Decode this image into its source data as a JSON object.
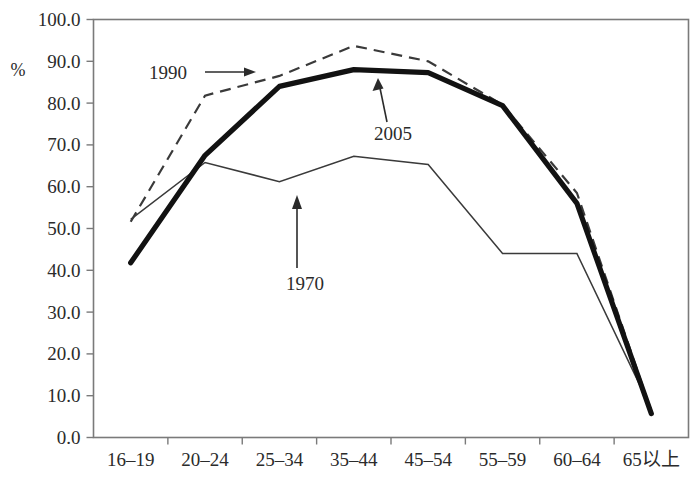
{
  "chart_data": {
    "type": "line",
    "title": "",
    "xlabel": "",
    "ylabel": "%",
    "ylim": [
      0.0,
      100.0
    ],
    "ytick_step": 10.0,
    "grid": false,
    "legend_position": "inline-annotations",
    "categories": [
      "16–19",
      "20–24",
      "25–34",
      "35–44",
      "45–54",
      "55–59",
      "60–64",
      "65以上"
    ],
    "ytick_labels": [
      "100.0",
      "90.0",
      "80.0",
      "70.0",
      "60.0",
      "50.0",
      "40.0",
      "30.0",
      "20.0",
      "10.0",
      "0.0"
    ],
    "ytick_values": [
      100.0,
      90.0,
      80.0,
      70.0,
      60.0,
      50.0,
      40.0,
      30.0,
      20.0,
      10.0,
      0.0
    ],
    "series": [
      {
        "name": "1970",
        "style": "thin-solid",
        "color": "#3a3a3a",
        "values": [
          52.2,
          65.8,
          61.2,
          67.3,
          65.3,
          44.0,
          44.0,
          6.8
        ]
      },
      {
        "name": "1990",
        "style": "dashed",
        "color": "#3a3a3a",
        "values": [
          51.6,
          81.8,
          86.5,
          93.7,
          90.0,
          79.6,
          58.5,
          6.2
        ]
      },
      {
        "name": "2005",
        "style": "thick-solid",
        "color": "#121212",
        "values": [
          41.8,
          67.5,
          84.0,
          88.0,
          87.3,
          79.4,
          56.0,
          5.7
        ]
      }
    ],
    "annotations": [
      {
        "label": "1990",
        "target_series": "1990",
        "arrow": "right"
      },
      {
        "label": "2005",
        "target_series": "2005",
        "arrow": "up"
      },
      {
        "label": "1970",
        "target_series": "1970",
        "arrow": "up"
      }
    ]
  }
}
